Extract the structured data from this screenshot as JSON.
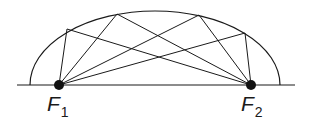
{
  "diagram": {
    "type": "semi-ellipse reflection diagram",
    "stroke_color": "#1a1a1a",
    "baseline": {
      "x1": 17,
      "x2": 295,
      "y": 85
    },
    "ellipse": {
      "cx": 155,
      "cy": 85,
      "rx": 125,
      "ry": 74
    },
    "foci": [
      {
        "name": "F",
        "subscript": "1",
        "x": 59,
        "y": 85
      },
      {
        "name": "F",
        "subscript": "2",
        "x": 251,
        "y": 85
      }
    ],
    "reflection_points": [
      {
        "x": 67,
        "y": 29
      },
      {
        "x": 117,
        "y": 14
      },
      {
        "x": 199,
        "y": 15
      },
      {
        "x": 245,
        "y": 33
      }
    ]
  }
}
